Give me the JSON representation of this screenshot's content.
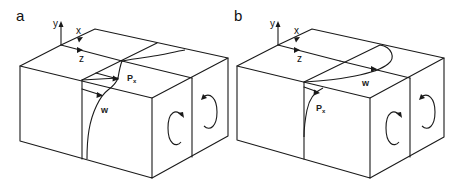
{
  "panels": [
    {
      "id": "a",
      "label": "a",
      "axes": {
        "y": "y",
        "x": "x",
        "z": "z"
      },
      "labels": {
        "pressure": "P",
        "pressure_sub": "x",
        "velocity": "w"
      },
      "vortices": 2
    },
    {
      "id": "b",
      "label": "b",
      "axes": {
        "y": "y",
        "x": "x",
        "z": "z"
      },
      "labels": {
        "pressure": "P",
        "pressure_sub": "x",
        "velocity": "w"
      },
      "vortices": 2
    }
  ],
  "colors": {
    "line": "#1a1a1a",
    "background": "#ffffff"
  }
}
